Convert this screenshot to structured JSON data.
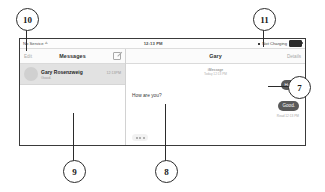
{
  "figure": {
    "callouts": [
      {
        "id": "7",
        "number": "7"
      },
      {
        "id": "8",
        "number": "8"
      },
      {
        "id": "9",
        "number": "9"
      },
      {
        "id": "10",
        "number": "10"
      },
      {
        "id": "11",
        "number": "11"
      }
    ]
  },
  "device": {
    "status_bar": {
      "carrier": "No Service",
      "wifi_icon": "wifi-icon",
      "time": "12:13 PM",
      "bluetooth_icon": "bluetooth-icon",
      "charge_state": "Not Charging",
      "battery_icon": "battery-icon"
    },
    "left_pane": {
      "nav": {
        "edit_label": "Edit",
        "title": "Messages",
        "compose_icon": "compose-icon"
      },
      "conversations": [
        {
          "avatar": "contact-avatar",
          "name": "Gary Rosenzweig",
          "time": "12:13PM",
          "preview": "Good."
        }
      ]
    },
    "right_pane": {
      "nav": {
        "title": "Gary",
        "details_label": "Details"
      },
      "thread": {
        "service": "iMessage",
        "timestamp": "Today 12:13 PM",
        "messages": [
          {
            "direction": "out",
            "text": "Hello"
          },
          {
            "direction": "in",
            "text": "How are you?"
          },
          {
            "direction": "out",
            "text": "Good."
          }
        ],
        "read_receipt": "Read 12:13 PM",
        "typing_indicator": "typing-indicator"
      }
    }
  },
  "colors": {
    "outgoing_bubble": "#5a5a5a",
    "incoming_bubble": "#f0f0f0",
    "selected_row": "#e2e2e2",
    "muted_text": "#a8a8a8",
    "frame_border": "#3a3a3a"
  }
}
